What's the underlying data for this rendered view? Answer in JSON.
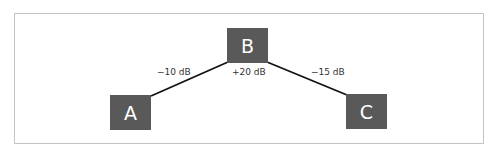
{
  "diagram": {
    "colors": {
      "node_fill": "#595959",
      "node_text": "#ffffff",
      "line": "#111111",
      "frame": "#c4c4c4",
      "label": "#333333"
    },
    "nodes": [
      {
        "id": "A",
        "label": "A"
      },
      {
        "id": "B",
        "label": "B"
      },
      {
        "id": "C",
        "label": "C"
      }
    ],
    "edges": [
      {
        "from": "A",
        "to": "B",
        "label": "−10 dB"
      },
      {
        "from": "B",
        "to": "C",
        "label": "−15 dB"
      }
    ],
    "node_annotations": [
      {
        "node": "B",
        "label": "+20 dB"
      }
    ]
  }
}
